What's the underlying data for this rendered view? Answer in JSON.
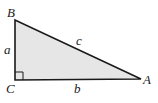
{
  "diagram": {
    "type": "right-triangle",
    "vertices": {
      "A": {
        "label": "A",
        "x": 141,
        "y": 79
      },
      "B": {
        "label": "B",
        "x": 15,
        "y": 20
      },
      "C": {
        "label": "C",
        "x": 15,
        "y": 80
      }
    },
    "sides": {
      "a": {
        "label": "a"
      },
      "b": {
        "label": "b"
      },
      "c": {
        "label": "c"
      }
    },
    "right_angle_at": "C",
    "colors": {
      "fill": "#e6e6e6",
      "stroke": "#1a1a1a"
    }
  }
}
